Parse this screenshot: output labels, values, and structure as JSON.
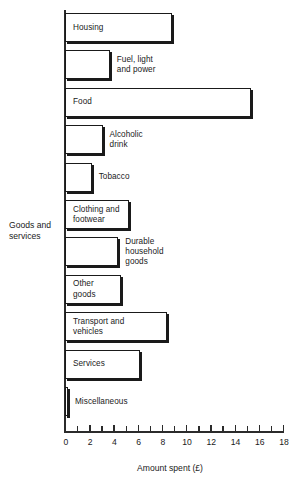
{
  "chart_data": {
    "type": "bar",
    "orientation": "horizontal",
    "title": "",
    "xlabel": "Amount spent (£)",
    "ylabel": "Goods and services",
    "xlim": [
      0,
      18
    ],
    "xticks": [
      0,
      2,
      4,
      6,
      8,
      10,
      12,
      14,
      16,
      18
    ],
    "xtick_labels": [
      "0",
      "2",
      "4",
      "6",
      "8",
      "10",
      "12",
      "14",
      "16",
      "18"
    ],
    "minor_tick_interval": 1,
    "grid": false,
    "legend": null,
    "bar_style": {
      "fill": "#ffffff",
      "edge": "#1a1a1a",
      "shadow": "#1a1a1a"
    },
    "categories": [
      "Housing",
      "Fuel, light and power",
      "Food",
      "Alcoholic drink",
      "Tobacco",
      "Clothing and footwear",
      "Durable household goods",
      "Other goods",
      "Transport and vehicles",
      "Services",
      "Miscellaneous"
    ],
    "values": [
      8.8,
      3.7,
      15.4,
      3.1,
      2.2,
      5.3,
      4.4,
      4.6,
      8.4,
      6.2,
      0.2
    ],
    "bars": [
      {
        "label": "Housing",
        "value": 8.8,
        "label_lines": "Housing",
        "label_position": "inside"
      },
      {
        "label": "Fuel, light and power",
        "value": 3.7,
        "label_lines": "Fuel, light\nand power",
        "label_position": "outside"
      },
      {
        "label": "Food",
        "value": 15.4,
        "label_lines": "Food",
        "label_position": "inside"
      },
      {
        "label": "Alcoholic drink",
        "value": 3.1,
        "label_lines": "Alcoholic\ndrink",
        "label_position": "outside"
      },
      {
        "label": "Tobacco",
        "value": 2.2,
        "label_lines": "Tobacco",
        "label_position": "outside"
      },
      {
        "label": "Clothing and footwear",
        "value": 5.3,
        "label_lines": "Clothing and\nfootwear",
        "label_position": "inside"
      },
      {
        "label": "Durable household goods",
        "value": 4.4,
        "label_lines": "Durable\nhousehold\ngoods",
        "label_position": "outside"
      },
      {
        "label": "Other goods",
        "value": 4.6,
        "label_lines": "Other\ngoods",
        "label_position": "inside"
      },
      {
        "label": "Transport and vehicles",
        "value": 8.4,
        "label_lines": "Transport and\nvehicles",
        "label_position": "inside"
      },
      {
        "label": "Services",
        "value": 6.2,
        "label_lines": "Services",
        "label_position": "inside"
      },
      {
        "label": "Miscellaneous",
        "value": 0.2,
        "label_lines": "Miscellaneous",
        "label_position": "outside"
      }
    ]
  },
  "layout": {
    "origin_x_px": 65,
    "px_per_unit": 12.11,
    "first_bar_top_px": 13,
    "bar_height_px": 29,
    "bar_pitch_px": 37.4,
    "outside_label_offset_px": 7
  }
}
